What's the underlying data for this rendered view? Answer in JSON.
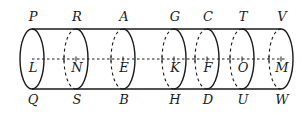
{
  "diagram": {
    "type": "cylinder-cross-sections",
    "stroke_color": "#1a1a1a",
    "top_labels": [
      {
        "id": "P",
        "x": 33,
        "y": 16
      },
      {
        "id": "R",
        "x": 77,
        "y": 16
      },
      {
        "id": "A",
        "x": 124,
        "y": 16
      },
      {
        "id": "G",
        "x": 175,
        "y": 16
      },
      {
        "id": "C",
        "x": 208,
        "y": 16
      },
      {
        "id": "T",
        "x": 243,
        "y": 16
      },
      {
        "id": "V",
        "x": 282,
        "y": 16
      }
    ],
    "center_labels": [
      {
        "id": "L",
        "x": 33,
        "y": 67
      },
      {
        "id": "N",
        "x": 77,
        "y": 67
      },
      {
        "id": "E",
        "x": 124,
        "y": 67
      },
      {
        "id": "K",
        "x": 175,
        "y": 67
      },
      {
        "id": "F",
        "x": 208,
        "y": 67
      },
      {
        "id": "O",
        "x": 243,
        "y": 67
      },
      {
        "id": "M",
        "x": 282,
        "y": 67
      }
    ],
    "bottom_labels": [
      {
        "id": "Q",
        "x": 33,
        "y": 99
      },
      {
        "id": "S",
        "x": 77,
        "y": 99
      },
      {
        "id": "B",
        "x": 124,
        "y": 99
      },
      {
        "id": "H",
        "x": 175,
        "y": 99
      },
      {
        "id": "D",
        "x": 208,
        "y": 99
      },
      {
        "id": "U",
        "x": 243,
        "y": 99
      },
      {
        "id": "W",
        "x": 282,
        "y": 99
      }
    ],
    "geometry": {
      "top_y": 29,
      "bottom_y": 89,
      "axis_y": 59,
      "rx": 12,
      "left_end_cx": 32,
      "section_xs": [
        76,
        123,
        174,
        207,
        242,
        281
      ]
    }
  }
}
